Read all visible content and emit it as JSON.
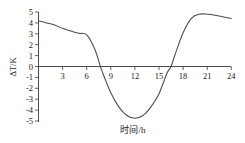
{
  "chart_data": {
    "type": "line",
    "title": "",
    "xlabel": "时间/h",
    "ylabel": "ΔT/K",
    "xlim": [
      0,
      24
    ],
    "ylim": [
      -5,
      5
    ],
    "grid": false,
    "legend": null,
    "x_ticks": [
      3,
      6,
      9,
      12,
      15,
      18,
      21,
      24
    ],
    "x_tick_labels": [
      "3",
      "6",
      "9",
      "12",
      "15",
      "18",
      "21",
      "24"
    ],
    "y_ticks": [
      -5,
      -4,
      -3,
      -2,
      -1,
      0,
      1,
      2,
      3,
      4,
      5
    ],
    "y_tick_labels": [
      "-5",
      "-4",
      "-3",
      "-2",
      "-1",
      "0",
      "1",
      "2",
      "3",
      "4",
      "5"
    ],
    "x": [
      0,
      1,
      2,
      3,
      4,
      5,
      6,
      7,
      7.7,
      8,
      9,
      10,
      11,
      12,
      13,
      14,
      15,
      16,
      16.5,
      17,
      18,
      19,
      20,
      21,
      22,
      23,
      24
    ],
    "y": [
      4.2,
      4.0,
      3.8,
      3.5,
      3.25,
      3.05,
      2.9,
      1.6,
      0.0,
      -0.6,
      -2.4,
      -3.7,
      -4.5,
      -4.75,
      -4.5,
      -3.7,
      -2.5,
      -0.6,
      0.0,
      1.1,
      3.1,
      4.4,
      4.8,
      4.8,
      4.7,
      4.55,
      4.4
    ],
    "zero_crossings": [
      7.7,
      16.5
    ],
    "minimum": {
      "x": 12,
      "y": -4.75
    },
    "maximum": {
      "x": 20.5,
      "y": 4.8
    },
    "start_value": 4.2,
    "end_value": 4.4,
    "series_name": "ΔT",
    "line_color": "#4a4a4a",
    "axis_color": "#3a3a3a",
    "background_color": "#ffffff"
  }
}
